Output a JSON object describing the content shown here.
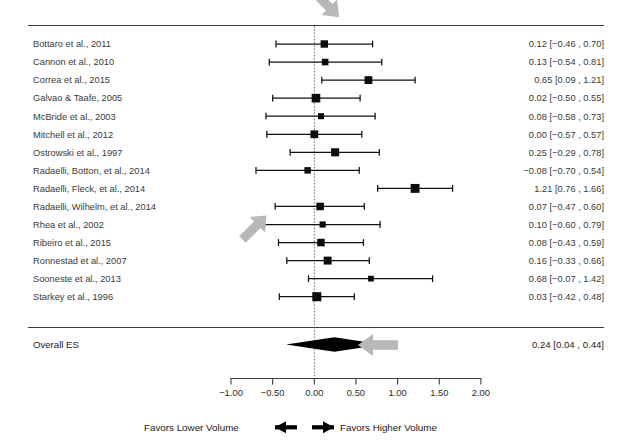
{
  "figure": {
    "type": "forest-plot",
    "title_cut_off": "",
    "overall_row_label": "Overall ES",
    "overall_value_text": "0.24 [0.04 , 0.44]"
  },
  "axis": {
    "ticks": [
      "-1.00",
      "-0.50",
      "0.00",
      "0.50",
      "1.00",
      "1.50",
      "2.00"
    ],
    "tick_values": [
      -1.0,
      -0.5,
      0.0,
      0.5,
      1.0,
      1.5,
      2.0
    ],
    "min": -1.0,
    "max": 2.0,
    "zero_reference": 0.0
  },
  "footer": {
    "left_label": "Favors Lower Volume",
    "right_label": "Favors Higher Volume",
    "left_arrow_icon": "arrow-left-icon",
    "right_arrow_icon": "arrow-right-icon"
  },
  "annotations": [
    {
      "name": "callout-arrow-top",
      "icon": "arrow-down-left-icon",
      "direction": "down-left",
      "color": "#b8b8b8"
    },
    {
      "name": "callout-arrow-radaelli-fleck",
      "icon": "arrow-up-right-icon",
      "direction": "up-right",
      "color": "#b8b8b8"
    },
    {
      "name": "callout-arrow-overall",
      "icon": "arrow-left-icon",
      "direction": "left",
      "color": "#b8b8b8"
    }
  ],
  "chart_data": {
    "type": "forest",
    "title": "",
    "xlabel": "",
    "ylabel": "",
    "xlim": [
      -1.0,
      2.0
    ],
    "grid": false,
    "legend": "none",
    "zero_line": 0.0,
    "effect_measure": "ES",
    "columns": [
      "Study",
      "ES [95% CI]"
    ],
    "studies": [
      {
        "label": "Bottaro et al., 2011",
        "es": 0.12,
        "lo": -0.46,
        "hi": 0.7,
        "weight": 0.5,
        "text": "0.12 [−0.46 , 0.70]"
      },
      {
        "label": "Cannon et al., 2010",
        "es": 0.13,
        "lo": -0.54,
        "hi": 0.81,
        "weight": 0.38,
        "text": "0.13 [−0.54 , 0.81]"
      },
      {
        "label": "Correa et al., 2015",
        "es": 0.65,
        "lo": 0.09,
        "hi": 1.21,
        "weight": 0.56,
        "text": "0.65 [0.09 , 1.21]"
      },
      {
        "label": "Galvao & Taafe, 2005",
        "es": 0.02,
        "lo": -0.5,
        "hi": 0.55,
        "weight": 0.68,
        "text": "0.02 [−0.50 , 0.55]"
      },
      {
        "label": "McBride et al., 2003",
        "es": 0.08,
        "lo": -0.58,
        "hi": 0.73,
        "weight": 0.3,
        "text": "0.08 [−0.58 , 0.73]"
      },
      {
        "label": "Mitchell et al., 2012",
        "es": 0.0,
        "lo": -0.57,
        "hi": 0.57,
        "weight": 0.55,
        "text": "0.00 [−0.57 , 0.57]"
      },
      {
        "label": "Ostrowski et al., 1997",
        "es": 0.25,
        "lo": -0.29,
        "hi": 0.78,
        "weight": 0.6,
        "text": "0.25 [−0.29 , 0.78]"
      },
      {
        "label": "Radaelli, Botton, et al., 2014",
        "es": -0.08,
        "lo": -0.7,
        "hi": 0.54,
        "weight": 0.36,
        "text": "−0.08 [−0.70 , 0.54]"
      },
      {
        "label": "Radaelli, Fleck, et al., 2014",
        "es": 1.21,
        "lo": 0.76,
        "hi": 1.66,
        "weight": 0.72,
        "text": "1.21 [0.76 , 1.66]"
      },
      {
        "label": "Radaelli, Wilhelm, et al., 2014",
        "es": 0.07,
        "lo": -0.47,
        "hi": 0.6,
        "weight": 0.52,
        "text": "0.07 [−0.47 , 0.60]"
      },
      {
        "label": "Rhea et al., 2002",
        "es": 0.1,
        "lo": -0.6,
        "hi": 0.79,
        "weight": 0.32,
        "text": "0.10 [−0.60 , 0.79]"
      },
      {
        "label": "Ribeiro et al., 2015",
        "es": 0.08,
        "lo": -0.43,
        "hi": 0.59,
        "weight": 0.52,
        "text": "0.08 [−0.43 , 0.59]"
      },
      {
        "label": "Ronnestad et al., 2007",
        "es": 0.16,
        "lo": -0.33,
        "hi": 0.66,
        "weight": 0.58,
        "text": "0.16 [−0.33 , 0.66]"
      },
      {
        "label": "Sooneste et al., 2013",
        "es": 0.68,
        "lo": -0.07,
        "hi": 1.42,
        "weight": 0.26,
        "text": "0.68 [−0.07 , 1.42]"
      },
      {
        "label": "Starkey et al., 1996",
        "es": 0.03,
        "lo": -0.42,
        "hi": 0.48,
        "weight": 0.74,
        "text": "0.03 [−0.42 , 0.48]"
      }
    ],
    "overall": {
      "label": "Overall ES",
      "es": 0.24,
      "lo": 0.04,
      "hi": 0.44,
      "text": "0.24 [0.04 , 0.44]"
    }
  }
}
